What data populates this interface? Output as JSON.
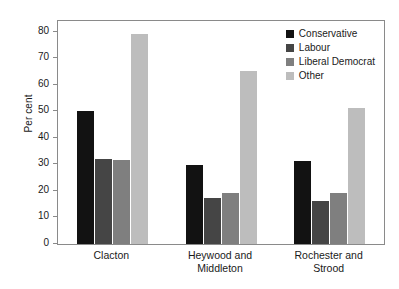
{
  "chart_data": {
    "type": "bar",
    "title": "",
    "subtitle": "",
    "xlabel": "",
    "ylabel": "Per cent",
    "categories": [
      "Clacton",
      "Heywood and Middleton",
      "Rochester and Strood"
    ],
    "category_lines": [
      [
        "Clacton"
      ],
      [
        "Heywood and",
        "Middleton"
      ],
      [
        "Rochester and",
        "Strood"
      ]
    ],
    "series": [
      {
        "name": "Conservative",
        "color": "#121212",
        "values": [
          50.0,
          29.7,
          31.4
        ]
      },
      {
        "name": "Labour",
        "color": "#454545",
        "values": [
          32.0,
          17.5,
          16.2
        ]
      },
      {
        "name": "Liberal Democrat",
        "color": "#7f7f7f",
        "values": [
          31.7,
          19.2,
          19.2
        ]
      },
      {
        "name": "Other",
        "color": "#bdbdbd",
        "values": [
          79.0,
          65.0,
          51.2
        ]
      }
    ],
    "ylim": [
      0,
      84
    ],
    "yticks": [
      0,
      10,
      20,
      30,
      40,
      50,
      60,
      70,
      80
    ],
    "ytick_labels": [
      "0",
      "10",
      "20",
      "30",
      "40",
      "50",
      "60",
      "70",
      "80"
    ],
    "grid": false,
    "legend_position": "top-right",
    "axis_frame": "box"
  }
}
